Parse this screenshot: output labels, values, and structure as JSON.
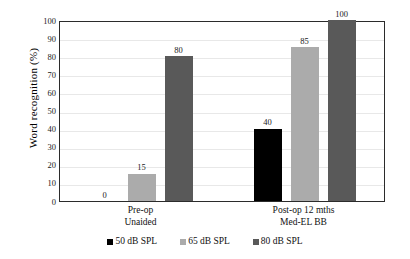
{
  "chart_data": {
    "type": "bar",
    "title": "",
    "xlabel": "",
    "ylabel": "Word  recognition  (%)",
    "ylim": [
      0,
      100
    ],
    "ytick_step": 10,
    "ytick_labels": [
      "100",
      "90",
      "80",
      "70",
      "60",
      "50",
      "40",
      "30",
      "20",
      "10",
      "0"
    ],
    "grid": true,
    "legend_position": "bottom",
    "categories": [
      "Pre-op\nUnaided",
      "Post-op 12 mths\nMed-EL BB"
    ],
    "category_labels": [
      {
        "line1": "Pre-op",
        "line2": "Unaided"
      },
      {
        "line1": "Post-op 12 mths",
        "line2": "Med-EL BB"
      }
    ],
    "series": [
      {
        "name": "50 dB SPL",
        "color": "#000000",
        "values": [
          0,
          40
        ],
        "value_labels": [
          "0",
          "40"
        ]
      },
      {
        "name": "65 dB SPL",
        "color": "#ababab",
        "values": [
          15,
          85
        ],
        "value_labels": [
          "15",
          "85"
        ]
      },
      {
        "name": "80 dB SPL",
        "color": "#595959",
        "values": [
          80,
          100
        ],
        "value_labels": [
          "80",
          "100"
        ]
      }
    ]
  },
  "legend": {
    "items": [
      {
        "label": "50 dB SPL",
        "color": "#000000"
      },
      {
        "label": "65 dB SPL",
        "color": "#ababab"
      },
      {
        "label": "80 dB SPL",
        "color": "#595959"
      }
    ]
  },
  "axes": {
    "y_title": "Word  recognition  (%)",
    "axis_color": "#2b2b2b",
    "grid_color": "#e8e8e8"
  }
}
